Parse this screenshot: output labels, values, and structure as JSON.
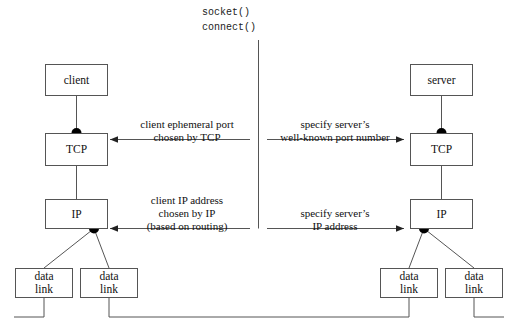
{
  "diagram": {
    "background": "#ffffff",
    "stroke": "#555555",
    "dot_color": "#000000",
    "syscalls": {
      "line1": "socket()",
      "line2": "connect()"
    },
    "client_side": {
      "app": "client",
      "transport": "TCP",
      "network": "IP",
      "datalink_left": {
        "line1": "data",
        "line2": "link"
      },
      "datalink_right": {
        "line1": "data",
        "line2": "link"
      }
    },
    "server_side": {
      "app": "server",
      "transport": "TCP",
      "network": "IP",
      "datalink_left": {
        "line1": "data",
        "line2": "link"
      },
      "datalink_right": {
        "line1": "data",
        "line2": "link"
      }
    },
    "labels": {
      "tcp_left": {
        "line1": "client ephemeral port",
        "line2": "chosen by TCP",
        "line3": ""
      },
      "tcp_right": {
        "line1": "specify server’s",
        "line2": "well-known port number",
        "line3": ""
      },
      "ip_left": {
        "line1": "client IP address",
        "line2": "chosen by IP",
        "line3": "(based on routing)"
      },
      "ip_right": {
        "line1": "specify server’s",
        "line2": "IP address",
        "line3": ""
      }
    }
  }
}
